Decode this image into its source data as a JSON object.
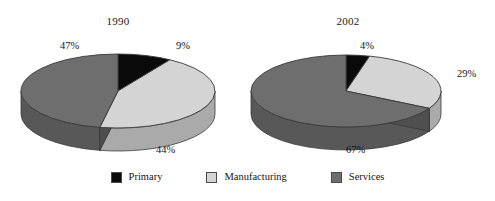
{
  "figure": {
    "background_color": "#ffffff",
    "text_color": "#141414"
  },
  "colors": {
    "primary": "#0a0a0a",
    "manufacturing": "#d4d4d4",
    "services": "#6e6e6e",
    "primary_side": "#050505",
    "manufacturing_side": "#b4b4b4",
    "services_side": "#585858",
    "outline": "#3a3a3a"
  },
  "legend": {
    "items": [
      {
        "label": "Primary",
        "color": "#0a0a0a",
        "key": "primary"
      },
      {
        "label": "Manufacturing",
        "color": "#d4d4d4",
        "key": "manufacturing"
      },
      {
        "label": "Services",
        "color": "#6e6e6e",
        "key": "services"
      }
    ]
  },
  "charts": [
    {
      "title": "1990",
      "labels": {
        "primary": "9%",
        "manufacturing": "44%",
        "services": "47%"
      }
    },
    {
      "title": "2002",
      "labels": {
        "primary": "4%",
        "manufacturing": "29%",
        "services": "67%"
      }
    }
  ],
  "chart_data": {
    "type": "pie",
    "title": "",
    "charts": [
      {
        "title": "1990",
        "categories": [
          "Primary",
          "Manufacturing",
          "Services"
        ],
        "values": [
          9,
          44,
          47
        ],
        "labels": [
          "9%",
          "44%",
          "47%"
        ],
        "units": "percent"
      },
      {
        "title": "2002",
        "categories": [
          "Primary",
          "Manufacturing",
          "Services"
        ],
        "values": [
          4,
          29,
          67
        ],
        "labels": [
          "4%",
          "29%",
          "67%"
        ],
        "units": "percent"
      }
    ],
    "legend": [
      "Primary",
      "Manufacturing",
      "Services"
    ],
    "legend_position": "bottom-center",
    "style": "3d-exploded-none",
    "xlabel": "",
    "ylabel": "",
    "grid": false
  }
}
